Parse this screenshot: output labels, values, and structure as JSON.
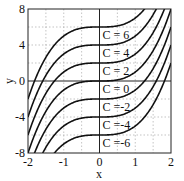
{
  "chart_data": {
    "type": "line",
    "title": "",
    "xlabel": "x",
    "ylabel": "y",
    "xlim": [
      -2,
      2
    ],
    "ylim": [
      -8,
      8
    ],
    "xticks": [
      -2,
      -1,
      0,
      1,
      2
    ],
    "yticks": [
      -8,
      -4,
      0,
      4,
      8
    ],
    "grid": true,
    "function": "y = x^3 + C",
    "series": [
      {
        "name": "C = 6",
        "C": 6
      },
      {
        "name": "C = 4",
        "C": 4
      },
      {
        "name": "C = 2",
        "C": 2
      },
      {
        "name": "C = 0",
        "C": 0
      },
      {
        "name": "C =-2",
        "C": -2
      },
      {
        "name": "C =-4",
        "C": -4
      },
      {
        "name": "C =-6",
        "C": -6
      }
    ],
    "annotations": [
      "C = 6",
      "C = 4",
      "C = 2",
      "C = 0",
      "C =-2",
      "C =-4",
      "C =-6"
    ]
  },
  "axes": {
    "xlabel": "x",
    "ylabel": "y",
    "xtick_labels": [
      "-2",
      "-1",
      "0",
      "1",
      "2"
    ],
    "ytick_labels": [
      "8",
      "4",
      "0",
      "-4",
      "-8"
    ]
  }
}
